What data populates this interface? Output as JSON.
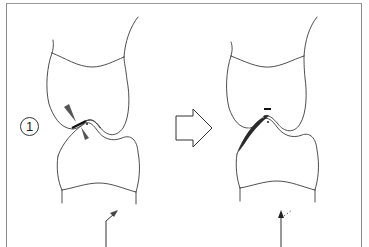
{
  "figure": {
    "step_label": "1",
    "panels": [
      {
        "id": "before",
        "description": "Upper and lower tooth in occlusion with contact point marked by two opposing triangular markers",
        "markers": [
          "contact-arrowhead-upper",
          "contact-arrowhead-lower",
          "contact-dot"
        ],
        "force_arrow": "angled"
      },
      {
        "id": "after",
        "description": "Same teeth after adjustment; shaded ground-off area on cusp slope with minus sign",
        "markers": [
          "minus-sign",
          "contact-dot",
          "shaded-reduction"
        ],
        "force_arrow": "vertical-with-dotted-deflection",
        "minus_symbol": "−"
      }
    ],
    "transition_arrow": "hollow-right-arrow"
  },
  "colors": {
    "line": "#3a3a3a",
    "marker": "#555555",
    "shade": "#2a2a2a",
    "frame": "#8a8a8a",
    "background": "#ffffff"
  }
}
